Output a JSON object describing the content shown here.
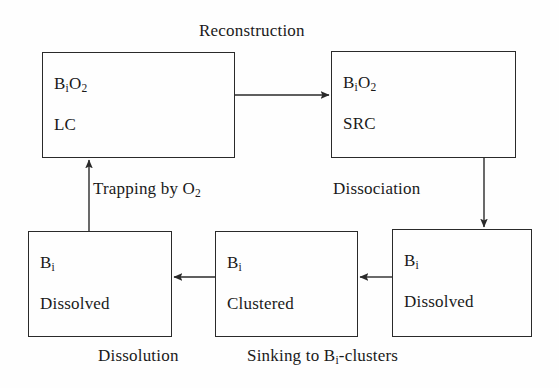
{
  "diagram": {
    "title_text": "Reconstruction",
    "background_color": "#fefefe",
    "stroke_color": "#2a2a2a",
    "text_color": "#1a1a1a",
    "boxes": [
      {
        "id": "bi-o2-lc",
        "line1_main": "B",
        "line1_sub": "i",
        "line1_rest": "O",
        "line1_rest_sub": "2",
        "line1_full": "BiO2",
        "line2": "LC",
        "x": 42,
        "y": 52,
        "w": 193,
        "h": 106
      },
      {
        "id": "bi-o2-src",
        "line1_main": "B",
        "line1_sub": "i",
        "line1_rest": "O",
        "line1_rest_sub": "2",
        "line1_full": "BiO2",
        "line2": "SRC",
        "x": 331,
        "y": 51,
        "w": 185,
        "h": 107
      },
      {
        "id": "bi-dissolved-left",
        "line1_main": "B",
        "line1_sub": "i",
        "line1_rest": "",
        "line1_rest_sub": "",
        "line1_full": "Bi",
        "line2": "Dissolved",
        "x": 28,
        "y": 231,
        "w": 144,
        "h": 106
      },
      {
        "id": "bi-clustered",
        "line1_main": "B",
        "line1_sub": "i",
        "line1_rest": "",
        "line1_rest_sub": "",
        "line1_full": "Bi",
        "line2": "Clustered",
        "x": 215,
        "y": 231,
        "w": 143,
        "h": 106
      },
      {
        "id": "bi-dissolved-right",
        "line1_main": "B",
        "line1_sub": "i",
        "line1_rest": "",
        "line1_rest_sub": "",
        "line1_full": "Bi",
        "line2": "Dissolved",
        "x": 392,
        "y": 229,
        "w": 140,
        "h": 108
      }
    ],
    "labels": [
      {
        "id": "reconstruction",
        "text": "Reconstruction",
        "x": 199,
        "y": 22
      },
      {
        "id": "trapping-by-o2",
        "text_main": "Trapping by O",
        "text_sub": "2",
        "x": 93,
        "y": 180
      },
      {
        "id": "dissociation",
        "text": "Dissociation",
        "x": 333,
        "y": 180
      },
      {
        "id": "dissolution",
        "text": "Dissolution",
        "x": 98,
        "y": 347
      },
      {
        "id": "sinking-to-bi-clusters",
        "text_pre": "Sinking to B",
        "text_sub": "i",
        "text_post": "-clusters",
        "x": 247,
        "y": 347
      }
    ],
    "arrows": [
      {
        "id": "lc-to-src",
        "from": "bi-o2-lc",
        "to": "bi-o2-src",
        "direction": "right",
        "x1": 235,
        "y1": 95,
        "x2": 329,
        "y2": 95
      },
      {
        "id": "src-to-dissolved-right",
        "from": "bi-o2-src",
        "to": "bi-dissolved-right",
        "direction": "down",
        "x1": 484,
        "y1": 158,
        "x2": 484,
        "y2": 227
      },
      {
        "id": "dissolved-right-to-clustered",
        "from": "bi-dissolved-right",
        "to": "bi-clustered",
        "direction": "left",
        "x1": 392,
        "y1": 277,
        "x2": 360,
        "y2": 277
      },
      {
        "id": "clustered-to-dissolved-left",
        "from": "bi-clustered",
        "to": "bi-dissolved-left",
        "direction": "left",
        "x1": 215,
        "y1": 277,
        "x2": 174,
        "y2": 277
      },
      {
        "id": "dissolved-left-to-lc",
        "from": "bi-dissolved-left",
        "to": "bi-o2-lc",
        "direction": "up",
        "x1": 89,
        "y1": 231,
        "x2": 89,
        "y2": 160
      }
    ]
  }
}
